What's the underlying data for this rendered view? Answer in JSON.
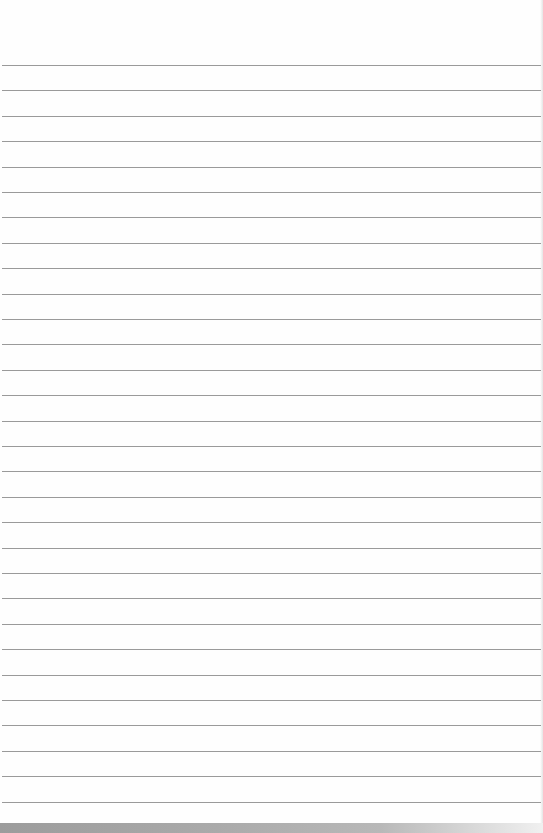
{
  "paper": {
    "type": "lined-notebook-page",
    "background_color": "#fefefe",
    "line_color": "#9a9a9a",
    "first_line_y": 65,
    "line_spacing": 25.4,
    "line_count": 30,
    "bottom_strip_color": "#a4a4a4"
  }
}
